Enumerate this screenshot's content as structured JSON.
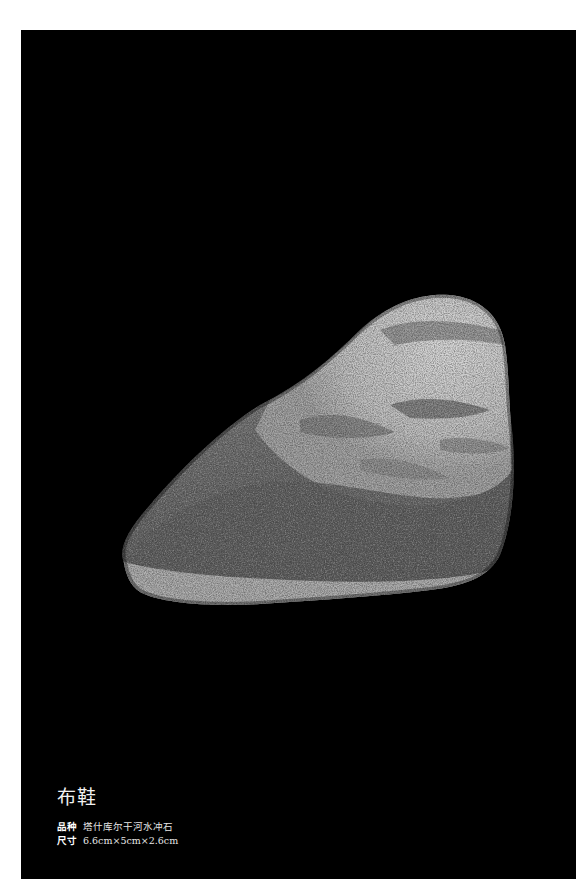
{
  "page": {
    "background": "#ffffff",
    "panel_color": "#000000"
  },
  "photo": {
    "subject": "stone-photo",
    "description": "Egg/triangular shaped river pebble with light grey mottled top and darker speckled body, pale band along bottom edge"
  },
  "caption": {
    "title": "布鞋",
    "rows": [
      {
        "label": "品种",
        "value": "塔什库尔干河水冲石"
      },
      {
        "label": "尺寸",
        "value": "6.6cm×5cm×2.6cm"
      }
    ]
  }
}
